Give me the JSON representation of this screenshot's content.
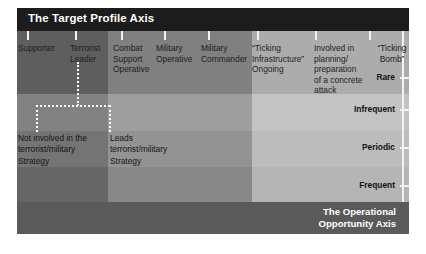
{
  "figure": {
    "header_title": "The Target Profile Axis",
    "footer_title": "The Operational\nOpportunity Axis",
    "colors": {
      "header_bar": "#1c1c1c",
      "footer_bar": "#5a5a5a",
      "column_low": "#636363",
      "column_mid": "#868686",
      "column_high": "#b4b4b4",
      "axis_line": "#f2f2f2",
      "connector": "#ffffff",
      "page_background": "#ffffff"
    }
  },
  "target_profile_axis": {
    "label": "The Target Profile Axis",
    "categories": [
      {
        "label": "Supporter"
      },
      {
        "label": "Terrorist\nLeader"
      },
      {
        "label": "Combat\nSupport\nOperative"
      },
      {
        "label": "Military\nOperative"
      },
      {
        "label": "Military\nCommander"
      },
      {
        "label": "“Ticking\nInfrastructure”\nOngoing"
      },
      {
        "label": "Involved in\nplanning/\npreparation\nof a  concrete\nattack"
      },
      {
        "label": "“Ticking\nBomb”"
      }
    ]
  },
  "operational_opportunity_axis": {
    "label": "The Operational Opportunity Axis",
    "levels": [
      {
        "label": "Rare"
      },
      {
        "label": "Infrequent"
      },
      {
        "label": "Periodic"
      },
      {
        "label": "Frequent"
      }
    ]
  },
  "strategy_notes": [
    {
      "text": "Not involved in the\nterrorist/military\n Strategy"
    },
    {
      "text": "Leads\nterrorist/military\nStrategy"
    }
  ]
}
